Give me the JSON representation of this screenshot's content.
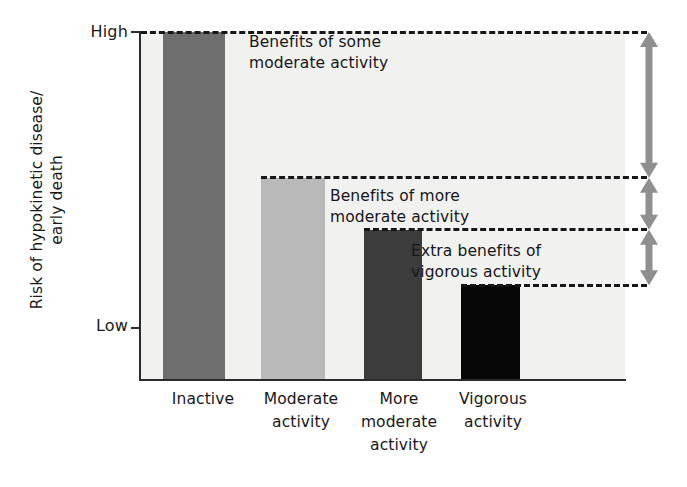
{
  "chart_data": {
    "type": "bar",
    "title": "",
    "xlabel": "",
    "ylabel": "Risk of hypokinetic disease/\nearly death",
    "ylabel_line1": "Risk of hypokinetic disease/",
    "ylabel_line2": "early death",
    "categories": [
      "Inactive",
      "Moderate activity",
      "More moderate activity",
      "Vigorous activity"
    ],
    "category_lines": [
      [
        "Inactive"
      ],
      [
        "Moderate",
        "activity"
      ],
      [
        "More",
        "moderate",
        "activity"
      ],
      [
        "Vigorous",
        "activity"
      ]
    ],
    "values": [
      100,
      58,
      43,
      27
    ],
    "ylim": [
      0,
      100
    ],
    "ytick_labels": [
      "High",
      "Low"
    ],
    "ytick_values": [
      100,
      15
    ],
    "grid": false,
    "legend": "none",
    "bar_colors": [
      "#6e6e6e",
      "#b9b9b9",
      "#3c3c3c",
      "#070707"
    ],
    "plot_background": "#f1f1ef",
    "axis_color": "#2b2b2b",
    "arrow_color": "#8f8f8f",
    "dash_color": "#17171a",
    "annotations": [
      {
        "id": "benefits-some-moderate",
        "line1": "Benefits of some",
        "line2": "moderate activity",
        "spans_from": 100,
        "spans_to": 58
      },
      {
        "id": "benefits-more-moderate",
        "line1": "Benefits of more",
        "line2": "moderate activity",
        "spans_from": 58,
        "spans_to": 43
      },
      {
        "id": "extra-benefits-vigorous",
        "line1": "Extra benefits of",
        "line2": "vigorous activity",
        "spans_from": 43,
        "spans_to": 27
      }
    ],
    "reference_lines": [
      100,
      58,
      43,
      27
    ],
    "arrows": [
      {
        "id": "arrow-some-moderate",
        "from": 100,
        "to": 58,
        "style": "double-headed"
      },
      {
        "id": "arrow-more-moderate",
        "from": 58,
        "to": 43,
        "style": "double-headed"
      },
      {
        "id": "arrow-vigorous",
        "from": 43,
        "to": 27,
        "style": "double-headed"
      }
    ]
  }
}
